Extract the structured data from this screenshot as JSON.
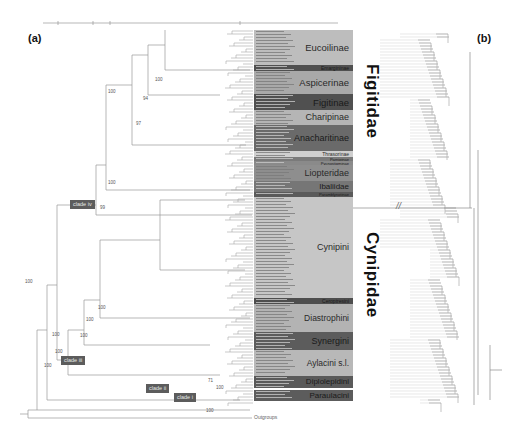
{
  "panels": {
    "a": "(a)",
    "b": "(b)"
  },
  "outgroup_label": "Outgroups",
  "families": [
    {
      "name": "Figitidae",
      "top": 62,
      "height": 120
    },
    {
      "name": "Cynipidae",
      "top": 228,
      "height": 120
    }
  ],
  "clade_tags": [
    {
      "label": "clade iv",
      "x": 70,
      "y": 203
    },
    {
      "label": "clade iii",
      "x": 61,
      "y": 354
    },
    {
      "label": "clade ii",
      "x": 146,
      "y": 384
    },
    {
      "label": "clade i",
      "x": 174,
      "y": 393
    }
  ],
  "groups": [
    {
      "name": "Eucoilinae",
      "top": 30,
      "height": 35,
      "color": "#bdbdbd",
      "font": 9.5,
      "dark": false
    },
    {
      "name": "Emargininae",
      "top": 65,
      "height": 6,
      "color": "#505050",
      "font": 5,
      "dark": true
    },
    {
      "name": "Aspicerinae",
      "top": 71,
      "height": 23,
      "color": "#a9a9a9",
      "font": 9.5,
      "dark": false
    },
    {
      "name": "Figitinae",
      "top": 94,
      "height": 16,
      "color": "#505050",
      "font": 9.5,
      "dark": true
    },
    {
      "name": "Charipinae",
      "top": 110,
      "height": 15,
      "color": "#b5b5b5",
      "font": 9,
      "dark": false
    },
    {
      "name": "Anacharitinae",
      "top": 125,
      "height": 26,
      "color": "#6a6a6a",
      "font": 9,
      "dark": true
    },
    {
      "name": "Thrasorinae",
      "top": 151,
      "height": 6,
      "color": "#cfcfcf",
      "font": 5,
      "dark": false
    },
    {
      "name": "Parnipinae",
      "top": 157,
      "height": 4,
      "color": "#7a7a7a",
      "font": 4,
      "dark": true
    },
    {
      "name": "Pycnostigminae",
      "top": 161,
      "height": 4,
      "color": "#8a8a8a",
      "font": 4,
      "dark": true
    },
    {
      "name": "Liopteridae",
      "top": 165,
      "height": 16,
      "color": "#8e8e8e",
      "font": 9,
      "dark": false
    },
    {
      "name": "Ibaliidae",
      "top": 181,
      "height": 11,
      "color": "#767676",
      "font": 8,
      "dark": true
    },
    {
      "name": "Paramblynotinae",
      "top": 192,
      "height": 5,
      "color": "#5a5a5a",
      "font": 4,
      "dark": true
    },
    {
      "name": "Cynipini",
      "top": 197,
      "height": 101,
      "color": "#c6c6c6",
      "font": 9,
      "dark": false
    },
    {
      "name": "Ceroptresini",
      "top": 298,
      "height": 6,
      "color": "#4e4e4e",
      "font": 5,
      "dark": true
    },
    {
      "name": "Diastrophini",
      "top": 304,
      "height": 28,
      "color": "#b3b3b3",
      "font": 8.5,
      "dark": false
    },
    {
      "name": "Synergini",
      "top": 332,
      "height": 18,
      "color": "#5c5c5c",
      "font": 9,
      "dark": true
    },
    {
      "name": "Aylacini s.l.",
      "top": 350,
      "height": 26,
      "color": "#b8b8b8",
      "font": 8.5,
      "dark": false
    },
    {
      "name": "Diplolepidini",
      "top": 376,
      "height": 12,
      "color": "#5a5a5a",
      "font": 8,
      "dark": true
    },
    {
      "name": "Paraulacini",
      "top": 390,
      "height": 11,
      "color": "#5c5c5c",
      "font": 8,
      "dark": true
    }
  ],
  "support_values": [
    {
      "text": "100",
      "x": 108,
      "y": 89
    },
    {
      "text": "97",
      "x": 136,
      "y": 121
    },
    {
      "text": "94",
      "x": 143,
      "y": 96
    },
    {
      "text": "100",
      "x": 155,
      "y": 77
    },
    {
      "text": "100",
      "x": 25,
      "y": 279
    },
    {
      "text": "100",
      "x": 55,
      "y": 349
    },
    {
      "text": "100",
      "x": 52,
      "y": 332
    },
    {
      "text": "100",
      "x": 44,
      "y": 363
    },
    {
      "text": "99",
      "x": 100,
      "y": 205
    },
    {
      "text": "100",
      "x": 108,
      "y": 180
    },
    {
      "text": "100",
      "x": 80,
      "y": 333
    },
    {
      "text": "100",
      "x": 86,
      "y": 317
    },
    {
      "text": "100",
      "x": 98,
      "y": 305
    },
    {
      "text": "71",
      "x": 208,
      "y": 378
    },
    {
      "text": "100",
      "x": 216,
      "y": 385
    },
    {
      "text": "100",
      "x": 206,
      "y": 408
    }
  ],
  "scale_bar": {
    "x1": 43,
    "x2": 338,
    "y": 23
  },
  "break_mark": "//"
}
